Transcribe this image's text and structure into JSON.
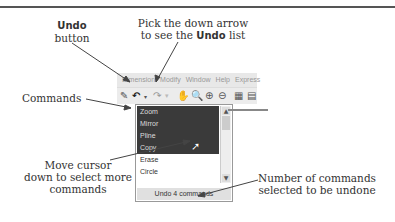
{
  "callouts": {
    "undo_button_title": "Undo",
    "undo_button_sub": "button",
    "pick_line1": "Pick the down arrow",
    "pick_line2_pre": "to see the ",
    "pick_line2_bold": "Undo",
    "pick_line2_post": " list",
    "commands": "Commands",
    "move_line1": "Move cursor",
    "move_line2": "down to select more",
    "move_line3": "commands",
    "number_line1": "Number of commands",
    "number_line2": "selected to be undone"
  },
  "menubar": [
    "Dimension",
    "Modify",
    "Window",
    "Help",
    "Express"
  ],
  "toolbar": {
    "icons": [
      "match-properties-icon",
      "undo-icon",
      "undo-dropdown-arrow-icon",
      "redo-icon",
      "pan-icon",
      "zoom-realtime-icon",
      "zoom-window-icon",
      "zoom-previous-icon",
      "properties-icon",
      "design-center-icon"
    ]
  },
  "undo_list": {
    "items": [
      {
        "label": "Zoom",
        "selected": true
      },
      {
        "label": "Mirror",
        "selected": true
      },
      {
        "label": "Pline",
        "selected": true
      },
      {
        "label": "Copy",
        "selected": true
      },
      {
        "label": "Erase",
        "selected": false
      },
      {
        "label": "Circle",
        "selected": false
      }
    ],
    "status": "Undo 4 commands"
  }
}
